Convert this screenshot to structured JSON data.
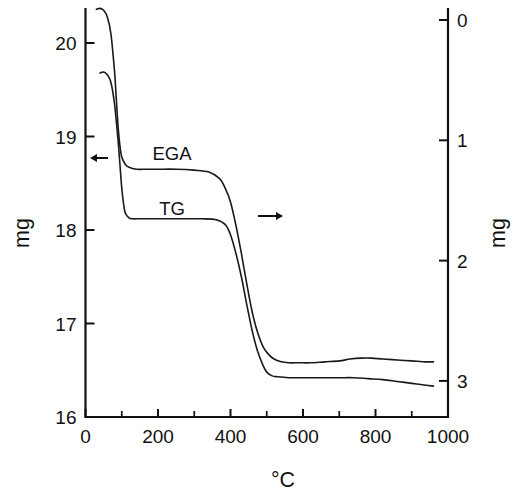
{
  "figure": {
    "background": "#ffffff",
    "line_color": "#1a1a1a",
    "axis_color": "#111111"
  },
  "axes": {
    "x_title": "°C",
    "y_left_title": "mg",
    "y_right_title": "mg",
    "x_ticks": [
      "0",
      "200",
      "400",
      "600",
      "800",
      "1000"
    ],
    "y_left_ticks": [
      "16",
      "17",
      "18",
      "19",
      "20"
    ],
    "y_right_ticks": [
      "0",
      "1",
      "2",
      "3"
    ]
  },
  "annotations": {
    "curve_label_ega": "EGA",
    "curve_label_tg": "TG",
    "arrow_left": "arrow-pointing-right-to-left-axis",
    "arrow_right": "arrow-pointing-right-to-right-axis"
  },
  "chart_data": {
    "type": "line",
    "title": "",
    "subtitle": "",
    "xlabel": "°C",
    "ylabel": "mg",
    "y2label": "mg",
    "grid": false,
    "legend": "inline-curve-labels",
    "xlim": [
      0,
      1000
    ],
    "ylim": [
      16,
      20.4
    ],
    "y2lim": [
      3.3,
      0
    ],
    "x_major_ticks": [
      0,
      200,
      400,
      600,
      800,
      1000
    ],
    "x_minor_ticks": [
      100,
      300,
      500,
      700,
      900
    ],
    "y_left_ticks": [
      16,
      17,
      18,
      19,
      20
    ],
    "y_right_ticks": [
      0,
      1,
      2,
      3
    ],
    "y_right_inverted": true,
    "series": [
      {
        "name": "EGA",
        "axis": "left",
        "color": "#1a1a1a",
        "x": [
          30,
          40,
          50,
          60,
          70,
          80,
          85,
          90,
          95,
          100,
          110,
          120,
          140,
          170,
          200,
          250,
          300,
          340,
          370,
          385,
          400,
          415,
          430,
          445,
          460,
          475,
          490,
          505,
          520,
          540,
          560,
          590,
          620,
          660,
          700,
          730,
          760,
          790,
          820,
          860,
          900,
          940,
          960
        ],
        "y": [
          20.36,
          20.37,
          20.35,
          20.28,
          20.1,
          19.7,
          19.4,
          19.1,
          18.9,
          18.78,
          18.7,
          18.67,
          18.65,
          18.65,
          18.65,
          18.65,
          18.64,
          18.62,
          18.55,
          18.45,
          18.3,
          18.05,
          17.75,
          17.42,
          17.12,
          16.9,
          16.75,
          16.67,
          16.62,
          16.59,
          16.58,
          16.58,
          16.58,
          16.59,
          16.6,
          16.62,
          16.63,
          16.63,
          16.62,
          16.61,
          16.6,
          16.59,
          16.59
        ]
      },
      {
        "name": "TG",
        "axis": "left",
        "color": "#1a1a1a",
        "x": [
          40,
          50,
          60,
          70,
          80,
          90,
          95,
          100,
          105,
          110,
          120,
          130,
          150,
          180,
          220,
          270,
          320,
          360,
          385,
          400,
          415,
          430,
          445,
          460,
          475,
          490,
          500,
          515,
          530,
          560,
          600,
          650,
          700,
          740,
          780,
          820,
          860,
          900,
          940,
          960
        ],
        "y": [
          19.68,
          19.69,
          19.66,
          19.58,
          19.35,
          18.95,
          18.7,
          18.45,
          18.28,
          18.18,
          18.13,
          18.12,
          18.12,
          18.12,
          18.12,
          18.12,
          18.12,
          18.11,
          18.06,
          17.95,
          17.75,
          17.5,
          17.2,
          16.92,
          16.7,
          16.55,
          16.48,
          16.44,
          16.43,
          16.42,
          16.42,
          16.42,
          16.42,
          16.42,
          16.41,
          16.4,
          16.38,
          16.36,
          16.34,
          16.33
        ]
      }
    ]
  }
}
